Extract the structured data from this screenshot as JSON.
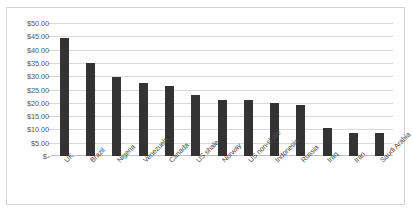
{
  "chart_data": {
    "type": "bar",
    "title": "",
    "subtitle": "",
    "xlabel": "",
    "ylabel": "",
    "categories": [
      "UK",
      "Brazil",
      "Nigeria",
      "Venezuela",
      "Canada",
      "US shale",
      "Norway",
      "US non-shale",
      "Indonesia",
      "Russia",
      "Iraq",
      "Iran",
      "Saudi Arabia"
    ],
    "values": [
      44.3,
      34.8,
      29.6,
      27.4,
      26.2,
      23.1,
      21.2,
      20.9,
      19.9,
      19.2,
      10.7,
      8.6,
      8.6
    ],
    "ytick_labels": [
      "$50.00",
      "$45.00",
      "$40.00",
      "$35.00",
      "$30.00",
      "$25.00",
      "$20.00",
      "$15.00",
      "$10.00",
      "$5.00",
      "$-"
    ],
    "ytick_values": [
      50,
      45,
      40,
      35,
      30,
      25,
      20,
      15,
      10,
      5,
      0
    ],
    "ylim": [
      0,
      50
    ],
    "grid": true,
    "legend": false,
    "legend_position": "none",
    "bar_color": "#333333",
    "gridline_color": "#d9d9d9",
    "frame_color": "#d4d4d4",
    "axis_label_color": "#595959"
  }
}
